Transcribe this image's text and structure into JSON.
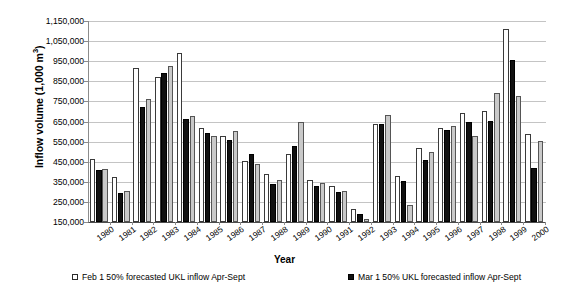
{
  "chart_data": {
    "type": "bar",
    "title": "",
    "xlabel": "Year",
    "ylabel": "Inflow volume (1,000 m3)",
    "ylabel_base": "Inflow volume (1,000 m",
    "ylabel_sup": "3",
    "ylabel_tail": ")",
    "ylim": [
      150000,
      1150000
    ],
    "ytick_step": 100000,
    "grid": true,
    "legend_position": "bottom",
    "categories": [
      "1980",
      "1981",
      "1982",
      "1983",
      "1984",
      "1985",
      "1986",
      "1987",
      "1988",
      "1989",
      "1990",
      "1991",
      "1992",
      "1993",
      "1994",
      "1995",
      "1996",
      "1997",
      "1998",
      "1999",
      "2000"
    ],
    "ytick_labels": [
      "1,150,000",
      "1,050,000",
      "950,000",
      "850,000",
      "750,000",
      "650,000",
      "550,000",
      "450,000",
      "350,000",
      "250,000",
      "150,000"
    ],
    "ytick_values": [
      1150000,
      1050000,
      950000,
      850000,
      750000,
      650000,
      550000,
      450000,
      350000,
      250000,
      150000
    ],
    "series": [
      {
        "name": "Feb 1 50% forecasted UKL inflow Apr-Sept",
        "key": "feb",
        "color": "#ffffff",
        "values": [
          465000,
          375000,
          915000,
          870000,
          990000,
          620000,
          580000,
          455000,
          390000,
          490000,
          360000,
          330000,
          215000,
          640000,
          380000,
          520000,
          620000,
          690000,
          700000,
          1110000,
          590000
        ]
      },
      {
        "name": "Mar 1 50% UKL forecasted inflow Apr-Sept",
        "key": "mar",
        "color": "#111111",
        "values": [
          410000,
          295000,
          720000,
          890000,
          665000,
          595000,
          560000,
          490000,
          340000,
          530000,
          330000,
          300000,
          190000,
          640000,
          355000,
          460000,
          610000,
          650000,
          655000,
          955000,
          420000
        ]
      },
      {
        "name": "Actual UKL inflow Apr-Sept",
        "key": "act",
        "color": "#c9c9c9",
        "values": [
          415000,
          305000,
          760000,
          925000,
          675000,
          580000,
          605000,
          440000,
          360000,
          650000,
          345000,
          305000,
          165000,
          680000,
          235000,
          500000,
          630000,
          580000,
          790000,
          775000,
          555000
        ]
      }
    ]
  },
  "axis": {
    "x_title": "Year"
  },
  "legend": {
    "entries": [
      {
        "label": "Feb 1 50% forecasted UKL inflow Apr-Sept",
        "swatch": "feb"
      },
      {
        "label": "Mar 1 50% UKL forecasted inflow Apr-Sept",
        "swatch": "mar"
      }
    ]
  }
}
